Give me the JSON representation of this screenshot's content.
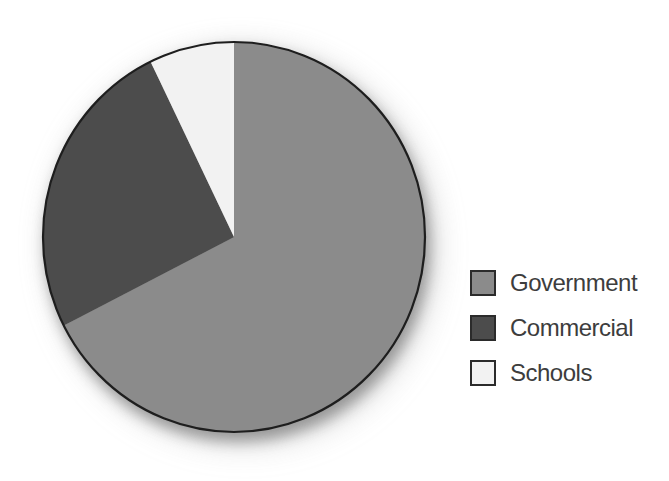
{
  "figure": {
    "background_color": "#ffffff"
  },
  "chart_data": {
    "type": "pie",
    "title": "",
    "categories": [
      "Government",
      "Commercial",
      "Schools"
    ],
    "values": [
      67.5,
      25.3,
      7.2
    ],
    "values_note": "percent of circle, estimated from slice angles; no numeric labels shown in figure",
    "start_angle_deg": 0,
    "direction": "clockwise",
    "colors": [
      "#8b8b8b",
      "#4c4c4c",
      "#f2f2f2"
    ],
    "outline_color": "#1e1e1e",
    "legend": {
      "position": "right",
      "entries": [
        {
          "label": "Government",
          "swatch_color": "#8b8b8b"
        },
        {
          "label": "Commercial",
          "swatch_color": "#4c4c4c"
        },
        {
          "label": "Schools",
          "swatch_color": "#f2f2f2"
        }
      ],
      "swatch_border_color": "#2b2b2b",
      "text_color": "#3d3d3d"
    }
  }
}
